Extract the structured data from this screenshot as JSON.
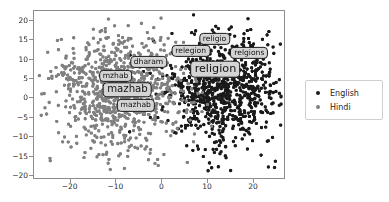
{
  "figure": {
    "background": "#ffffff",
    "width": 389,
    "height": 202
  },
  "chart_data": {
    "type": "scatter",
    "title": "",
    "xlabel": "",
    "ylabel": "",
    "xlim": [
      -28,
      27
    ],
    "ylim": [
      -21,
      22.5
    ],
    "grid": false,
    "legend_position": "right",
    "xticks": [
      -20,
      -10,
      0,
      10,
      20
    ],
    "xtick_labels": [
      "−20",
      "−10",
      "0",
      "10",
      "20"
    ],
    "yticks": [
      -20,
      -15,
      -10,
      -5,
      0,
      5,
      10,
      15,
      20
    ],
    "ytick_labels": [
      "−20",
      "−15",
      "−10",
      "−5",
      "0",
      "5",
      "10",
      "15",
      "20"
    ],
    "series": [
      {
        "name": "English",
        "color": "#1a1a1a",
        "marker": "o",
        "marker_size": 3.4,
        "n_points": 900,
        "x_center": 13.5,
        "y_center": 2.0,
        "x_spread": 7.0,
        "y_spread": 7.2
      },
      {
        "name": "Hindi",
        "color": "#808080",
        "marker": "o",
        "marker_size": 3.4,
        "n_points": 900,
        "x_center": -9.0,
        "y_center": 1.5,
        "x_spread": 7.4,
        "y_spread": 7.6
      }
    ],
    "annotations": [
      {
        "text": "religio",
        "x": 11.4,
        "y": 15.4,
        "font_size": 7.6,
        "lang": "English"
      },
      {
        "text": "relegion",
        "x": 6.2,
        "y": 12.2,
        "font_size": 7.6,
        "lang": "English"
      },
      {
        "text": "relgions",
        "x": 19.0,
        "y": 11.8,
        "font_size": 7.6,
        "lang": "English"
      },
      {
        "text": "religion",
        "x": 11.6,
        "y": 7.6,
        "font_size": 11.2,
        "lang": "English"
      },
      {
        "text": "dharam",
        "x": -3.0,
        "y": 9.4,
        "font_size": 7.6,
        "lang": "Hindi"
      },
      {
        "text": "mzhab",
        "x": -10.2,
        "y": 5.8,
        "font_size": 7.6,
        "lang": "Hindi"
      },
      {
        "text": "mazhab",
        "x": -7.6,
        "y": 2.2,
        "font_size": 10.2,
        "lang": "Hindi"
      },
      {
        "text": "mazhab",
        "x": -5.8,
        "y": -1.8,
        "font_size": 7.6,
        "lang": "Hindi"
      }
    ]
  },
  "legend": {
    "entries": [
      {
        "label": "English",
        "color": "#1a1a1a"
      },
      {
        "label": "Hindi",
        "color": "#808080"
      }
    ]
  }
}
